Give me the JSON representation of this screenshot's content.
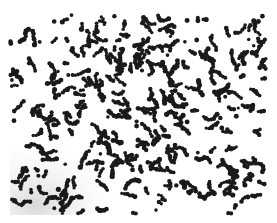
{
  "image": {
    "description": "Grayscale micrograph of dark irregular particle clusters scattered on a white background",
    "width": 277,
    "height": 223,
    "background_color": "#ffffff",
    "particle_color": "#1a1a1a",
    "field": {
      "x": 10,
      "y": 15,
      "width": 256,
      "height": 200
    },
    "lower_left_shading_color": "#d9d9d9"
  },
  "pattern": {
    "seed": 7,
    "cluster_count": 330,
    "min_dots": 1,
    "max_dots": 7,
    "dot_radius_min": 1.6,
    "dot_radius_max": 2.6,
    "step": 2.8
  }
}
